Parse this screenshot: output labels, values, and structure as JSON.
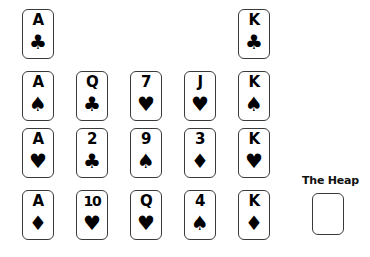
{
  "board": {
    "background_color": "#ffffff",
    "card_border_color": "#3a3a3a",
    "card_face_color": "#ffffff",
    "pip_color": "#000000",
    "card_width": 32,
    "card_height": 50,
    "column_x": [
      22,
      76,
      130,
      184,
      238
    ],
    "row_y": [
      9,
      71,
      128,
      190
    ]
  },
  "cards": [
    {
      "rank": "A",
      "suit": "clubs",
      "suit_glyph": "♣",
      "row": 0,
      "col": 0
    },
    {
      "rank": "K",
      "suit": "clubs",
      "suit_glyph": "♣",
      "row": 0,
      "col": 4
    },
    {
      "rank": "A",
      "suit": "spades",
      "suit_glyph": "♠",
      "row": 1,
      "col": 0
    },
    {
      "rank": "Q",
      "suit": "clubs",
      "suit_glyph": "♣",
      "row": 1,
      "col": 1
    },
    {
      "rank": "7",
      "suit": "hearts",
      "suit_glyph": "♥",
      "row": 1,
      "col": 2
    },
    {
      "rank": "J",
      "suit": "hearts",
      "suit_glyph": "♥",
      "row": 1,
      "col": 3
    },
    {
      "rank": "K",
      "suit": "spades",
      "suit_glyph": "♠",
      "row": 1,
      "col": 4
    },
    {
      "rank": "A",
      "suit": "hearts",
      "suit_glyph": "♥",
      "row": 2,
      "col": 0
    },
    {
      "rank": "2",
      "suit": "clubs",
      "suit_glyph": "♣",
      "row": 2,
      "col": 1
    },
    {
      "rank": "9",
      "suit": "spades",
      "suit_glyph": "♠",
      "row": 2,
      "col": 2
    },
    {
      "rank": "3",
      "suit": "diamonds",
      "suit_glyph": "♦",
      "row": 2,
      "col": 3
    },
    {
      "rank": "K",
      "suit": "hearts",
      "suit_glyph": "♥",
      "row": 2,
      "col": 4
    },
    {
      "rank": "A",
      "suit": "diamonds",
      "suit_glyph": "♦",
      "row": 3,
      "col": 0
    },
    {
      "rank": "10",
      "suit": "hearts",
      "suit_glyph": "♥",
      "row": 3,
      "col": 1
    },
    {
      "rank": "Q",
      "suit": "hearts",
      "suit_glyph": "♥",
      "row": 3,
      "col": 2
    },
    {
      "rank": "4",
      "suit": "spades",
      "suit_glyph": "♠",
      "row": 3,
      "col": 3
    },
    {
      "rank": "K",
      "suit": "diamonds",
      "suit_glyph": "♦",
      "row": 3,
      "col": 4
    }
  ],
  "heap": {
    "label": "The Heap",
    "label_x": 302,
    "label_y": 174,
    "slot_x": 312,
    "slot_y": 193,
    "is_empty": true,
    "card_count": 0
  }
}
